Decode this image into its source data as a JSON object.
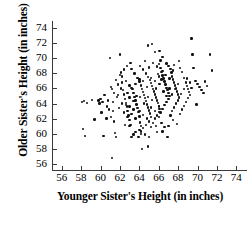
{
  "chart_data": {
    "type": "scatter",
    "title": "",
    "xlabel": "Younger Sister's Height (in inches)",
    "ylabel": "Older Sister's Height (in inches)",
    "xlim": [
      55,
      75
    ],
    "ylim": [
      55.2,
      74.8
    ],
    "xticks": [
      56,
      58,
      60,
      62,
      64,
      66,
      68,
      70,
      72,
      74
    ],
    "yticks": [
      56,
      58,
      60,
      62,
      64,
      66,
      68,
      70,
      72,
      74
    ],
    "grid": false,
    "legend": null,
    "marker_color": "#111111",
    "axis_color": "#3a3a3a",
    "points": [
      [
        58.1,
        64.2
      ],
      [
        58.3,
        64.3
      ],
      [
        58.6,
        64.1
      ],
      [
        58.2,
        60.6
      ],
      [
        58.4,
        59.7
      ],
      [
        59.1,
        64.5
      ],
      [
        59.4,
        61.9
      ],
      [
        59.8,
        64.4
      ],
      [
        59.9,
        64.0
      ],
      [
        60.0,
        64.6
      ],
      [
        60.2,
        64.2
      ],
      [
        60.3,
        59.7
      ],
      [
        60.6,
        62.0
      ],
      [
        60.8,
        64.4
      ],
      [
        60.9,
        63.2
      ],
      [
        61.0,
        70.0
      ],
      [
        61.1,
        66.2
      ],
      [
        61.2,
        65.9
      ],
      [
        61.3,
        63.0
      ],
      [
        61.4,
        61.6
      ],
      [
        61.5,
        60.1
      ],
      [
        61.6,
        59.6
      ],
      [
        61.2,
        56.8
      ],
      [
        61.7,
        64.9
      ],
      [
        61.8,
        66.5
      ],
      [
        61.9,
        63.4
      ],
      [
        62.0,
        70.5
      ],
      [
        62.1,
        68.1
      ],
      [
        62.2,
        66.8
      ],
      [
        62.3,
        65.8
      ],
      [
        62.4,
        65.2
      ],
      [
        62.5,
        64.6
      ],
      [
        62.6,
        64.1
      ],
      [
        62.7,
        63.6
      ],
      [
        62.8,
        63.0
      ],
      [
        62.9,
        62.4
      ],
      [
        63.0,
        61.8
      ],
      [
        63.1,
        61.2
      ],
      [
        63.2,
        59.6
      ],
      [
        62.2,
        67.6
      ],
      [
        62.6,
        67.0
      ],
      [
        63.0,
        66.4
      ],
      [
        63.3,
        65.9
      ],
      [
        63.4,
        65.4
      ],
      [
        63.5,
        64.9
      ],
      [
        63.6,
        64.4
      ],
      [
        63.7,
        63.9
      ],
      [
        63.8,
        63.4
      ],
      [
        63.9,
        62.9
      ],
      [
        64.0,
        62.3
      ],
      [
        64.1,
        61.5
      ],
      [
        64.2,
        61.0
      ],
      [
        64.0,
        60.5
      ],
      [
        63.6,
        60.2
      ],
      [
        63.4,
        59.9
      ],
      [
        63.2,
        68.6
      ],
      [
        63.5,
        68.0
      ],
      [
        63.8,
        67.4
      ],
      [
        64.0,
        66.9
      ],
      [
        64.2,
        66.4
      ],
      [
        64.3,
        65.9
      ],
      [
        64.4,
        65.5
      ],
      [
        64.5,
        65.1
      ],
      [
        64.6,
        64.7
      ],
      [
        64.7,
        64.3
      ],
      [
        64.8,
        63.9
      ],
      [
        64.9,
        63.5
      ],
      [
        65.0,
        63.1
      ],
      [
        65.1,
        62.7
      ],
      [
        65.2,
        62.2
      ],
      [
        65.0,
        61.6
      ],
      [
        64.7,
        61.2
      ],
      [
        64.4,
        60.8
      ],
      [
        64.2,
        60.3
      ],
      [
        63.9,
        59.6
      ],
      [
        64.1,
        69.0
      ],
      [
        64.4,
        68.5
      ],
      [
        64.7,
        68.0
      ],
      [
        64.9,
        67.5
      ],
      [
        65.1,
        67.1
      ],
      [
        65.2,
        66.7
      ],
      [
        65.3,
        66.3
      ],
      [
        65.4,
        65.9
      ],
      [
        65.5,
        65.6
      ],
      [
        65.6,
        65.2
      ],
      [
        65.7,
        64.8
      ],
      [
        65.8,
        64.4
      ],
      [
        65.9,
        64.1
      ],
      [
        66.0,
        63.7
      ],
      [
        66.1,
        63.3
      ],
      [
        66.0,
        62.9
      ],
      [
        65.8,
        62.4
      ],
      [
        65.6,
        62.0
      ],
      [
        65.4,
        61.4
      ],
      [
        65.2,
        60.9
      ],
      [
        65.0,
        59.6
      ],
      [
        65.3,
        71.9
      ],
      [
        64.9,
        71.7
      ],
      [
        65.6,
        70.8
      ],
      [
        66.0,
        69.2
      ],
      [
        66.2,
        68.7
      ],
      [
        66.3,
        68.2
      ],
      [
        66.4,
        67.7
      ],
      [
        66.5,
        67.3
      ],
      [
        66.6,
        66.9
      ],
      [
        66.7,
        66.5
      ],
      [
        66.8,
        66.1
      ],
      [
        66.9,
        65.8
      ],
      [
        67.0,
        65.4
      ],
      [
        67.1,
        65.0
      ],
      [
        67.0,
        64.6
      ],
      [
        66.8,
        64.2
      ],
      [
        66.6,
        63.8
      ],
      [
        66.4,
        63.3
      ],
      [
        66.2,
        62.8
      ],
      [
        66.0,
        62.2
      ],
      [
        66.3,
        61.4
      ],
      [
        66.6,
        60.9
      ],
      [
        66.9,
        59.6
      ],
      [
        66.1,
        71.0
      ],
      [
        66.4,
        70.2
      ],
      [
        66.8,
        69.3
      ],
      [
        67.2,
        68.6
      ],
      [
        67.3,
        68.1
      ],
      [
        67.4,
        67.6
      ],
      [
        67.5,
        67.2
      ],
      [
        67.6,
        66.8
      ],
      [
        67.7,
        66.4
      ],
      [
        67.8,
        66.0
      ],
      [
        67.9,
        65.6
      ],
      [
        68.0,
        65.2
      ],
      [
        68.1,
        64.8
      ],
      [
        68.0,
        64.4
      ],
      [
        67.8,
        64.0
      ],
      [
        67.6,
        63.5
      ],
      [
        67.4,
        63.0
      ],
      [
        67.2,
        62.4
      ],
      [
        67.5,
        61.8
      ],
      [
        67.9,
        61.3
      ],
      [
        68.2,
        68.7
      ],
      [
        68.4,
        68.2
      ],
      [
        68.6,
        67.4
      ],
      [
        68.8,
        66.8
      ],
      [
        68.9,
        66.3
      ],
      [
        69.0,
        65.9
      ],
      [
        69.1,
        65.5
      ],
      [
        69.2,
        65.1
      ],
      [
        69.0,
        64.7
      ],
      [
        68.8,
        64.2
      ],
      [
        68.6,
        63.7
      ],
      [
        68.4,
        63.2
      ],
      [
        68.2,
        62.6
      ],
      [
        69.4,
        72.6
      ],
      [
        69.5,
        70.5
      ],
      [
        69.6,
        68.7
      ],
      [
        69.8,
        67.0
      ],
      [
        70.0,
        66.6
      ],
      [
        70.2,
        66.2
      ],
      [
        70.4,
        65.8
      ],
      [
        70.6,
        65.4
      ],
      [
        70.8,
        66.9
      ],
      [
        71.0,
        66.3
      ],
      [
        69.9,
        63.9
      ],
      [
        71.3,
        70.5
      ],
      [
        71.5,
        68.4
      ],
      [
        63.0,
        64.8
      ],
      [
        63.4,
        64.3
      ],
      [
        63.7,
        65.0
      ],
      [
        64.1,
        64.9
      ],
      [
        64.5,
        64.0
      ],
      [
        64.9,
        64.9
      ],
      [
        65.3,
        64.5
      ],
      [
        65.7,
        66.0
      ],
      [
        66.1,
        66.6
      ],
      [
        66.5,
        65.6
      ],
      [
        62.8,
        65.4
      ],
      [
        63.2,
        66.1
      ],
      [
        63.6,
        66.6
      ],
      [
        64.0,
        67.2
      ],
      [
        64.4,
        67.0
      ],
      [
        64.8,
        66.2
      ],
      [
        65.2,
        67.4
      ],
      [
        65.6,
        67.0
      ],
      [
        66.0,
        67.6
      ],
      [
        66.4,
        68.3
      ],
      [
        62.4,
        62.8
      ],
      [
        62.8,
        62.2
      ],
      [
        63.2,
        62.6
      ],
      [
        63.6,
        62.0
      ],
      [
        64.0,
        63.0
      ],
      [
        64.4,
        62.5
      ],
      [
        64.8,
        62.0
      ],
      [
        65.2,
        63.5
      ],
      [
        65.6,
        63.0
      ],
      [
        66.0,
        63.6
      ],
      [
        61.8,
        65.1
      ],
      [
        62.2,
        64.0
      ],
      [
        62.6,
        63.8
      ],
      [
        63.0,
        63.6
      ],
      [
        63.4,
        63.2
      ],
      [
        61.6,
        67.1
      ],
      [
        62.0,
        67.8
      ],
      [
        62.4,
        68.5
      ],
      [
        61.4,
        65.4
      ],
      [
        62.1,
        66.0
      ],
      [
        66.8,
        65.0
      ],
      [
        67.1,
        66.0
      ],
      [
        67.4,
        65.2
      ],
      [
        67.7,
        65.9
      ],
      [
        68.0,
        66.6
      ],
      [
        68.3,
        65.3
      ],
      [
        68.6,
        65.9
      ],
      [
        68.9,
        67.3
      ],
      [
        69.2,
        66.8
      ],
      [
        69.4,
        66.1
      ],
      [
        60.4,
        65.1
      ],
      [
        60.7,
        63.6
      ],
      [
        61.1,
        62.2
      ],
      [
        61.3,
        64.2
      ],
      [
        60.1,
        62.8
      ],
      [
        64.6,
        69.6
      ],
      [
        65.0,
        68.8
      ],
      [
        65.4,
        69.4
      ],
      [
        65.8,
        68.9
      ],
      [
        66.2,
        69.7
      ],
      [
        63.1,
        69.4
      ],
      [
        62.7,
        69.0
      ],
      [
        67.0,
        69.0
      ],
      [
        67.6,
        69.1
      ],
      [
        68.1,
        69.6
      ],
      [
        64.2,
        60.0
      ],
      [
        64.6,
        59.9
      ],
      [
        65.8,
        60.2
      ],
      [
        66.4,
        60.3
      ],
      [
        63.0,
        61.0
      ],
      [
        64.3,
        58.0
      ],
      [
        64.9,
        58.3
      ],
      [
        65.7,
        61.0
      ],
      [
        67.0,
        61.0
      ],
      [
        62.5,
        61.2
      ],
      [
        65.9,
        67.9
      ],
      [
        66.3,
        67.2
      ],
      [
        66.7,
        67.8
      ],
      [
        67.1,
        67.3
      ],
      [
        67.5,
        68.4
      ]
    ]
  },
  "axis": {
    "x_tick_labels": [
      "56",
      "58",
      "60",
      "62",
      "64",
      "66",
      "68",
      "70",
      "72",
      "74"
    ],
    "y_tick_labels": [
      "56",
      "58",
      "60",
      "62",
      "64",
      "66",
      "68",
      "70",
      "72",
      "74"
    ]
  }
}
